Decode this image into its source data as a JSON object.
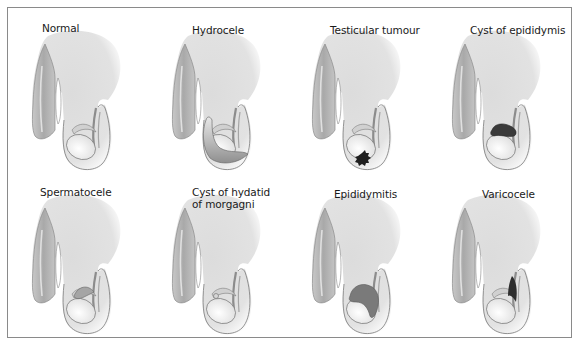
{
  "figure": {
    "panels": [
      {
        "label": "Normal",
        "condition": "normal"
      },
      {
        "label": "Hydrocele",
        "condition": "hydrocele"
      },
      {
        "label": "Testicular tumour",
        "condition": "testicular-tumour"
      },
      {
        "label": "Cyst of epididymis",
        "condition": "cyst-of-epididymis"
      },
      {
        "label": "Spermatocele",
        "condition": "spermatocele"
      },
      {
        "label": "Cyst of hydatid of morgagni",
        "label_line1": "Cyst of hydatid",
        "label_line2": "of morgagni",
        "condition": "cyst-of-hydatid-of-morgagni"
      },
      {
        "label": "Epididymitis",
        "condition": "epididymitis"
      },
      {
        "label": "Varicocele",
        "condition": "varicocele"
      }
    ],
    "colors": {
      "body_fill": "#e4e4e4",
      "shaft_fill": "#bdbdbd",
      "outline": "#7a7a7a",
      "testis_fill": "#f6f6f6",
      "lesion_dark": "#2a2a2a",
      "lesion_mid": "#6e6e6e"
    }
  }
}
